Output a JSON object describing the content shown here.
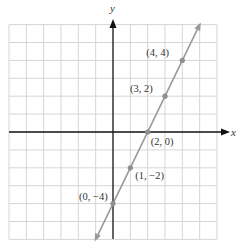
{
  "chart_data": {
    "type": "line",
    "title": "",
    "xlabel": "x",
    "ylabel": "y",
    "xlim": [
      -6,
      6
    ],
    "ylim": [
      -6,
      6
    ],
    "grid": true,
    "grid_step": 1,
    "line": {
      "slope": 2,
      "intercept": -4,
      "equation": "y = 2x - 4",
      "arrows": "both",
      "color": "#999999"
    },
    "points": [
      {
        "x": 4,
        "y": 4,
        "label": "(4, 4)"
      },
      {
        "x": 3,
        "y": 2,
        "label": "(3, 2)"
      },
      {
        "x": 2,
        "y": 0,
        "label": "(2, 0)"
      },
      {
        "x": 1,
        "y": -2,
        "label": "(1, −2)"
      },
      {
        "x": 0,
        "y": -4,
        "label": "(0, −4)"
      }
    ]
  },
  "colors": {
    "grid": "#d6d6d6",
    "axis": "#111111",
    "line": "#9a9a9a",
    "point": "#8f8f8f"
  }
}
